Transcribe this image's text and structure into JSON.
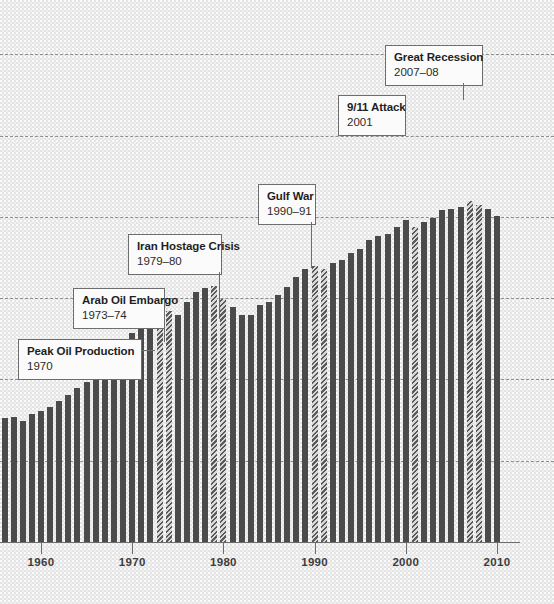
{
  "chart_data": {
    "type": "bar",
    "title": "",
    "subtitle": "",
    "xlabel": "",
    "ylabel": "",
    "grid": true,
    "legend_position": "none",
    "axis": {
      "x_ticks": [
        1960,
        1970,
        1980,
        1990,
        2000,
        2010
      ],
      "x_tick_labels": [
        "1960",
        "1970",
        "1980",
        "1990",
        "2000",
        "2010"
      ],
      "x_range": [
        1955,
        2011
      ],
      "y_range": [
        0,
        100
      ],
      "y_gridline_values": [
        15,
        30,
        45,
        60,
        75,
        90
      ],
      "y_tick_labels": []
    },
    "categories": [
      1955,
      1956,
      1957,
      1958,
      1959,
      1960,
      1961,
      1962,
      1963,
      1964,
      1965,
      1966,
      1967,
      1968,
      1969,
      1970,
      1971,
      1972,
      1973,
      1974,
      1975,
      1976,
      1977,
      1978,
      1979,
      1980,
      1981,
      1982,
      1983,
      1984,
      1985,
      1986,
      1987,
      1988,
      1989,
      1990,
      1991,
      1992,
      1993,
      1994,
      1995,
      1996,
      1997,
      1998,
      1999,
      2000,
      2001,
      2002,
      2003,
      2004,
      2005,
      2006,
      2007,
      2008,
      2009,
      2010
    ],
    "values": [
      22.4,
      22.8,
      23.0,
      22.4,
      23.6,
      24.2,
      24.9,
      26.1,
      27.2,
      28.4,
      29.6,
      31.4,
      32.5,
      34.6,
      36.5,
      38.5,
      39.5,
      41.7,
      43.9,
      42.6,
      41.8,
      44.3,
      46.1,
      46.9,
      47.3,
      44.9,
      43.3,
      41.8,
      41.9,
      43.8,
      44.3,
      45.5,
      47.0,
      48.9,
      50.3,
      50.9,
      50.3,
      51.4,
      52.1,
      53.4,
      54.0,
      55.7,
      56.4,
      56.8,
      58.1,
      59.5,
      58.2,
      59.0,
      59.7,
      61.2,
      61.5,
      61.9,
      63.0,
      62.2,
      61.5,
      60.1
    ],
    "highlighted": [
      1973,
      1974,
      1979,
      1980,
      1990,
      1991,
      2001,
      2007,
      2008
    ],
    "highlight_style": "diagonal-hatch",
    "bar_color": "#4b4b4b",
    "highlight_color": "#5a5a5a",
    "background_color": "#e4e4e4",
    "gridline_color": "#6e6e6e",
    "annotations": [
      {
        "id": "peak-oil-production",
        "title": "Peak Oil Production",
        "subtitle": "1970",
        "year": 1970
      },
      {
        "id": "arab-oil-embargo",
        "title": "Arab Oil Embargo",
        "subtitle": "1973–74",
        "year": 1973
      },
      {
        "id": "iran-hostage-crisis",
        "title": "Iran Hostage Crisis",
        "subtitle": "1979–80",
        "year": 1979
      },
      {
        "id": "gulf-war",
        "title": "Gulf War",
        "subtitle": "1990–91",
        "year": 1990
      },
      {
        "id": "september-11-attack",
        "title": "9/11 Attack",
        "subtitle": "2001",
        "year": 2001
      },
      {
        "id": "great-recession",
        "title": "Great Recession",
        "subtitle": "2007–08",
        "year": 2007
      }
    ]
  }
}
